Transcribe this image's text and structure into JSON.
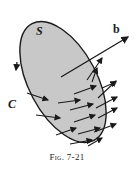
{
  "figure": {
    "caption": "Fig. 7-21",
    "labels": {
      "surface": "S",
      "curve": "C",
      "vector": "b"
    },
    "colors": {
      "surface_fill": "#c8c8c8",
      "stroke": "#1a1a1a",
      "background": "#ffffff"
    }
  }
}
